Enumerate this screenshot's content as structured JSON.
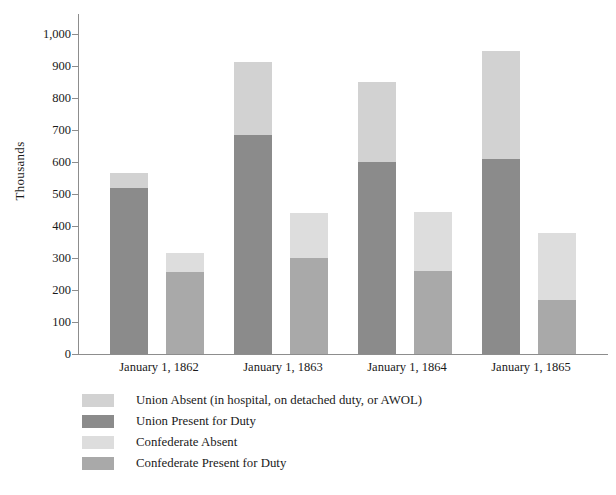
{
  "chart_data": {
    "type": "bar",
    "subtype": "grouped-stacked",
    "title": "",
    "xlabel": "",
    "ylabel": "Thousands",
    "ylim": [
      0,
      1000
    ],
    "ytick_step": 100,
    "ytick_labels": [
      "1,000",
      "900",
      "800",
      "700",
      "600",
      "500",
      "400",
      "300",
      "200",
      "100",
      "0"
    ],
    "ytick_values": [
      1000,
      900,
      800,
      700,
      600,
      500,
      400,
      300,
      200,
      100,
      0
    ],
    "grid": false,
    "legend_position": "below-left",
    "categories": [
      "January 1, 1862",
      "January 1, 1863",
      "January 1, 1864",
      "January 1, 1865"
    ],
    "series": [
      {
        "name": "Union Absent (in hospital, on detached duty, or AWOL)",
        "short_name": "Union Absent",
        "stack": "Union",
        "color": "#d2d2d2",
        "values": [
          45,
          227,
          250,
          337
        ]
      },
      {
        "name": "Union Present for Duty",
        "short_name": "Union Present",
        "stack": "Union",
        "color": "#8b8b8b",
        "values": [
          520,
          685,
          600,
          610
        ]
      },
      {
        "name": "Confederate Absent",
        "short_name": "Confederate Absent",
        "stack": "Confederate",
        "color": "#dddddd",
        "values": [
          60,
          140,
          185,
          208
        ]
      },
      {
        "name": "Confederate Present for Duty",
        "short_name": "Confederate Present",
        "stack": "Confederate",
        "color": "#a9a9a9",
        "values": [
          255,
          300,
          260,
          170
        ]
      }
    ],
    "stack_totals": {
      "Union": [
        565,
        912,
        850,
        947
      ],
      "Confederate": [
        315,
        440,
        445,
        378
      ]
    }
  },
  "legend": {
    "items": [
      {
        "label": "Union Absent (in hospital, on detached duty, or AWOL)",
        "color": "#d2d2d2"
      },
      {
        "label": "Union Present for Duty",
        "color": "#8b8b8b"
      },
      {
        "label": "Confederate Absent",
        "color": "#dddddd"
      },
      {
        "label": "Confederate Present for Duty",
        "color": "#a9a9a9"
      }
    ]
  },
  "axis": {
    "y_title": "Thousands"
  }
}
